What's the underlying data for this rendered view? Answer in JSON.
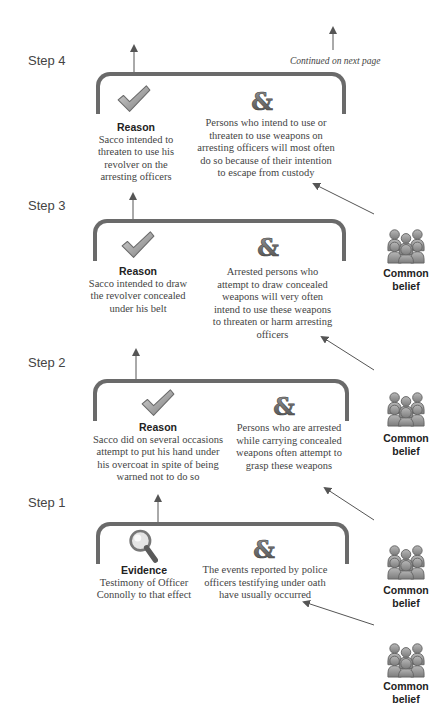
{
  "continued_note": "Continued on next page",
  "steps": [
    {
      "label": "Step 4",
      "left": {
        "icon": "check-icon",
        "title": "Reason",
        "text": "Sacco intended to threaten to use his revolver on the arresting officers"
      },
      "right": {
        "icon": "ampersand-icon",
        "text": "Persons who intend to use or threaten to use weapons on arresting officers will most often do so because of their intention to escape from custody"
      },
      "support": {
        "icon": "group-people-icon",
        "label": "Common belief"
      }
    },
    {
      "label": "Step 3",
      "left": {
        "icon": "check-icon",
        "title": "Reason",
        "text": "Sacco intended to draw the revolver concealed under his belt"
      },
      "right": {
        "icon": "ampersand-icon",
        "text": "Arrested persons who attempt to draw concealed weapons will very often intend to use these weapons to threaten or harm arresting officers"
      },
      "support": {
        "icon": "group-people-icon",
        "label": "Common belief"
      }
    },
    {
      "label": "Step 2",
      "left": {
        "icon": "check-icon",
        "title": "Reason",
        "text": "Sacco did on several occasions attempt to put his hand under his overcoat in spite of being warned not to do so"
      },
      "right": {
        "icon": "ampersand-icon",
        "text": "Persons who are arrested while carrying concealed weapons often attempt to grasp these weapons"
      },
      "support": {
        "icon": "group-people-icon",
        "label": "Common belief"
      }
    },
    {
      "label": "Step 1",
      "left": {
        "icon": "magnifier-icon",
        "title": "Evidence",
        "text": "Testimony of Officer Connolly to that effect"
      },
      "right": {
        "icon": "ampersand-icon",
        "text": "The events reported by police officers testifying under oath have usually occurred"
      },
      "support": {
        "icon": "group-people-icon",
        "label": "Common belief"
      }
    }
  ],
  "colors": {
    "bracket": "#6a6a6a",
    "arrow": "#555555",
    "text": "#444444"
  }
}
